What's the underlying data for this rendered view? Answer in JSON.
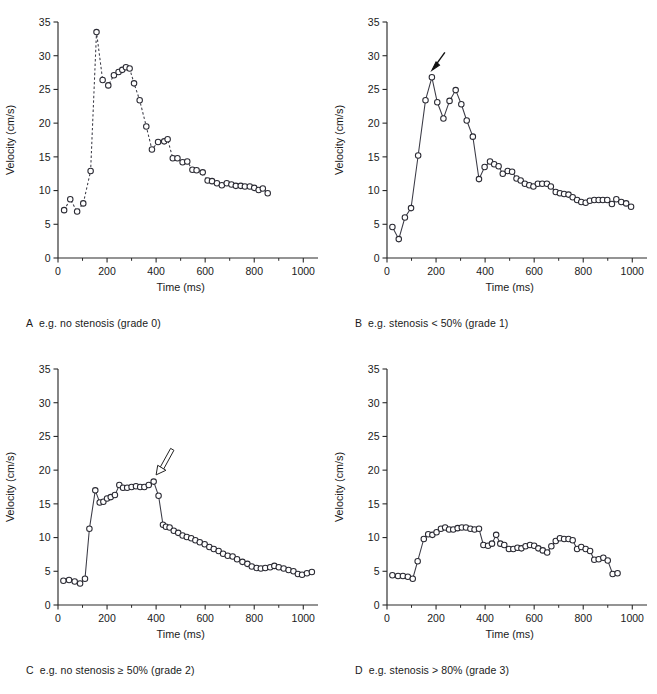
{
  "figure": {
    "title": "",
    "panel_order": [
      "A",
      "B",
      "C",
      "D"
    ]
  },
  "axes": {
    "xlabel": "Time (ms)",
    "ylabel": "Velocity (cm/s)",
    "xticks": [
      0,
      200,
      400,
      600,
      800,
      1000
    ],
    "yticks": [
      0,
      5,
      10,
      15,
      20,
      25,
      30,
      35
    ],
    "xlim": [
      0,
      1060
    ],
    "ylim": [
      0,
      35
    ],
    "xminor_step": 100,
    "grid": false,
    "legend": "none"
  },
  "panels": {
    "a": {
      "letter": "A",
      "caption": "e.g. no stenosis (grade 0)",
      "linestyle": "dashed",
      "annotation": null
    },
    "b": {
      "letter": "B",
      "caption": "e.g. stenosis < 50% (grade 1)",
      "linestyle": "solid",
      "annotation": {
        "type": "solid-arrow",
        "points_to_x": 185,
        "points_to_y": 27.8
      }
    },
    "c": {
      "letter": "C",
      "caption": "e.g. no stenosis ≥ 50% (grade 2)",
      "linestyle": "solid",
      "annotation": {
        "type": "hollow-arrow",
        "points_to_x": 400,
        "points_to_y": 19.4
      }
    },
    "d": {
      "letter": "D",
      "caption": "e.g. stenosis > 80% (grade 3)",
      "linestyle": "solid",
      "annotation": null
    }
  },
  "chart_data": [
    {
      "id": "a",
      "type": "line",
      "title": "A e.g. no stenosis (grade 0)",
      "xlabel": "Time (ms)",
      "ylabel": "Velocity (cm/s)",
      "xlim": [
        0,
        1060
      ],
      "ylim": [
        0,
        35
      ],
      "linestyle": "dashed",
      "marker": "open-circle",
      "x": [
        25,
        50,
        78,
        103,
        133,
        157,
        182,
        205,
        228,
        247,
        262,
        277,
        292,
        310,
        333,
        360,
        383,
        408,
        433,
        447,
        468,
        487,
        508,
        527,
        548,
        565,
        590,
        610,
        628,
        648,
        668,
        688,
        707,
        725,
        745,
        762,
        782,
        800,
        818,
        835,
        855,
        875,
        900
      ],
      "y": [
        7.1,
        8.7,
        6.9,
        8.1,
        12.9,
        33.5,
        26.4,
        25.6,
        27.1,
        27.6,
        27.9,
        28.3,
        28.1,
        25.9,
        23.4,
        19.5,
        16.1,
        17.2,
        17.3,
        17.6,
        14.8,
        14.8,
        14.2,
        14.3,
        13.1,
        13.0,
        12.7,
        11.5,
        11.4,
        11.1,
        10.8,
        11.1,
        10.9,
        10.7,
        10.7,
        10.6,
        10.6,
        10.4,
        10.1,
        10.3,
        9.6
      ]
    },
    {
      "id": "b",
      "type": "line",
      "title": "B e.g. stenosis < 50% (grade 1)",
      "xlabel": "Time (ms)",
      "ylabel": "Velocity (cm/s)",
      "xlim": [
        0,
        1060
      ],
      "ylim": [
        0,
        35
      ],
      "linestyle": "solid",
      "marker": "open-circle",
      "x": [
        22,
        48,
        73,
        98,
        127,
        157,
        183,
        205,
        230,
        255,
        280,
        303,
        325,
        350,
        375,
        398,
        420,
        437,
        455,
        472,
        492,
        510,
        528,
        545,
        562,
        580,
        597,
        615,
        633,
        652,
        668,
        688,
        705,
        722,
        740,
        757,
        775,
        792,
        810,
        827,
        845,
        863,
        880,
        898,
        917,
        935,
        955,
        975,
        995,
        1013
      ],
      "y": [
        4.6,
        2.8,
        6.0,
        7.4,
        15.2,
        23.4,
        26.8,
        23.1,
        20.7,
        23.3,
        24.9,
        22.8,
        20.4,
        18.0,
        11.7,
        13.5,
        14.3,
        13.9,
        13.6,
        12.5,
        12.9,
        12.8,
        11.8,
        11.5,
        11.0,
        10.8,
        10.6,
        11.0,
        11.0,
        11.0,
        10.6,
        9.8,
        9.6,
        9.5,
        9.4,
        9.0,
        8.6,
        8.3,
        8.2,
        8.5,
        8.6,
        8.6,
        8.6,
        8.6,
        8.0,
        8.7,
        8.3,
        8.1,
        7.6
      ],
      "annotation": {
        "type": "arrow",
        "label": "",
        "target_x": 183,
        "target_y": 26.8
      }
    },
    {
      "id": "c",
      "type": "line",
      "title": "C e.g. no stenosis ≥ 50% (grade 2)",
      "xlabel": "Time (ms)",
      "ylabel": "Velocity (cm/s)",
      "xlim": [
        0,
        1060
      ],
      "ylim": [
        0,
        35
      ],
      "linestyle": "solid",
      "marker": "open-circle",
      "x": [
        22,
        45,
        68,
        90,
        110,
        128,
        152,
        170,
        185,
        200,
        215,
        232,
        250,
        265,
        282,
        300,
        318,
        335,
        352,
        370,
        390,
        410,
        428,
        440,
        455,
        472,
        490,
        508,
        525,
        543,
        560,
        578,
        598,
        617,
        635,
        655,
        673,
        692,
        712,
        730,
        752,
        772,
        790,
        810,
        827,
        845,
        865,
        882,
        900,
        920,
        940,
        960,
        978,
        995,
        1015,
        1035
      ],
      "y": [
        3.6,
        3.7,
        3.5,
        3.2,
        3.9,
        11.3,
        17.0,
        15.2,
        15.3,
        15.8,
        16.0,
        16.3,
        17.8,
        17.4,
        17.4,
        17.5,
        17.6,
        17.5,
        17.5,
        17.8,
        18.3,
        16.2,
        11.9,
        11.6,
        11.5,
        11.0,
        10.7,
        10.3,
        10.1,
        9.9,
        9.6,
        9.3,
        9.0,
        8.6,
        8.3,
        8.0,
        7.6,
        7.3,
        7.2,
        6.8,
        6.4,
        6.1,
        5.7,
        5.5,
        5.4,
        5.5,
        5.6,
        5.8,
        5.6,
        5.4,
        5.2,
        5.0,
        4.6,
        4.5,
        4.7,
        4.9
      ],
      "annotation": {
        "type": "hollow-arrow",
        "label": "",
        "target_x": 400,
        "target_y": 19.0
      }
    },
    {
      "id": "d",
      "type": "line",
      "title": "D e.g. stenosis > 80% (grade 3)",
      "xlabel": "Time (ms)",
      "ylabel": "Velocity (cm/s)",
      "xlim": [
        0,
        1060
      ],
      "ylim": [
        0,
        35
      ],
      "linestyle": "solid",
      "marker": "open-circle",
      "x": [
        22,
        45,
        65,
        85,
        105,
        125,
        150,
        168,
        185,
        202,
        220,
        237,
        253,
        270,
        288,
        305,
        322,
        340,
        357,
        375,
        393,
        412,
        428,
        445,
        462,
        478,
        497,
        515,
        532,
        548,
        565,
        583,
        600,
        617,
        635,
        653,
        670,
        688,
        705,
        722,
        740,
        757,
        775,
        792,
        810,
        828,
        845,
        863,
        882,
        900,
        920,
        940,
        958,
        978,
        998,
        1018,
        1042
      ],
      "y": [
        4.4,
        4.3,
        4.3,
        4.2,
        3.9,
        6.5,
        9.8,
        10.5,
        10.4,
        10.8,
        11.3,
        11.5,
        11.2,
        11.2,
        11.4,
        11.5,
        11.5,
        11.3,
        11.2,
        11.3,
        8.9,
        8.8,
        9.1,
        10.4,
        9.1,
        8.9,
        8.3,
        8.3,
        8.5,
        8.4,
        8.7,
        8.9,
        8.8,
        8.4,
        8.1,
        7.8,
        8.7,
        9.5,
        9.9,
        9.8,
        9.8,
        9.6,
        8.3,
        8.6,
        8.3,
        8.0,
        6.7,
        6.8,
        7.0,
        6.6,
        4.6,
        4.7
      ]
    }
  ]
}
